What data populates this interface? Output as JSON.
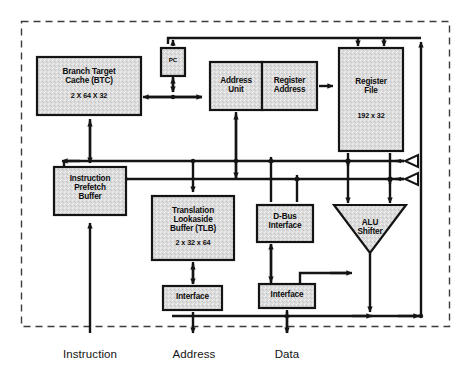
{
  "diagram": {
    "chip_boundary": "dashed-chip-outline",
    "blocks": [
      {
        "id": "btc",
        "label": "Branch Target\nCache (BTC)",
        "sub": "2 X 64 X 32",
        "x": 37,
        "y": 57,
        "w": 104,
        "h": 58
      },
      {
        "id": "prefetch",
        "label": "Instruction\nPrefetch\nBuffer",
        "sub": "",
        "x": 54,
        "y": 167,
        "w": 72,
        "h": 48
      },
      {
        "id": "pc",
        "label": "PC",
        "sub": "",
        "x": 161,
        "y": 48,
        "w": 24,
        "h": 24
      },
      {
        "id": "addr_unit",
        "label": "Address\nUnit",
        "sub": "",
        "x": 210,
        "y": 62,
        "w": 52,
        "h": 48
      },
      {
        "id": "reg_addr",
        "label": "Register\nAddress",
        "sub": "",
        "x": 262,
        "y": 62,
        "w": 55,
        "h": 48
      },
      {
        "id": "reg_file",
        "label": "Register\nFile",
        "sub": "192 x 32",
        "x": 339,
        "y": 48,
        "w": 64,
        "h": 103
      },
      {
        "id": "tlb",
        "label": "Translation\nLookaside\nBuffer (TLB)",
        "sub": "2 x 32 x 64",
        "x": 152,
        "y": 196,
        "w": 82,
        "h": 62
      },
      {
        "id": "dbus",
        "label": "D-Bus\nInterface",
        "sub": "",
        "x": 257,
        "y": 205,
        "w": 56,
        "h": 35
      },
      {
        "id": "alu",
        "label": "ALU\nShifter",
        "sub": "",
        "x": 334,
        "y": 207,
        "w": 72,
        "h": 44,
        "shape": "trapezoid-down"
      },
      {
        "id": "if_addr",
        "label": "Interface",
        "sub": "",
        "x": 163,
        "y": 288,
        "w": 59,
        "h": 22
      },
      {
        "id": "if_data",
        "label": "Interface",
        "sub": "",
        "x": 259,
        "y": 286,
        "w": 56,
        "h": 22
      }
    ],
    "bus_drivers": [
      {
        "id": "driver-top",
        "name": "tri-state-buffer",
        "x": 409,
        "y": 160
      },
      {
        "id": "driver-bottom",
        "name": "tri-state-buffer",
        "x": 409,
        "y": 178
      }
    ],
    "external_ports": [
      {
        "id": "port_instruction",
        "label": "Instruction",
        "x": 115,
        "y": 348
      },
      {
        "id": "port_address",
        "label": "Address",
        "x": 215,
        "y": 348
      },
      {
        "id": "port_data",
        "label": "Data",
        "x": 306,
        "y": 348
      }
    ],
    "colors": {
      "block_fill": "#d9d9d9",
      "block_stroke": "#141414",
      "bus_stroke": "#141414",
      "boundary_stroke": "#3c3c3c",
      "background": "#ffffff",
      "text": "#0d0d0d"
    }
  }
}
